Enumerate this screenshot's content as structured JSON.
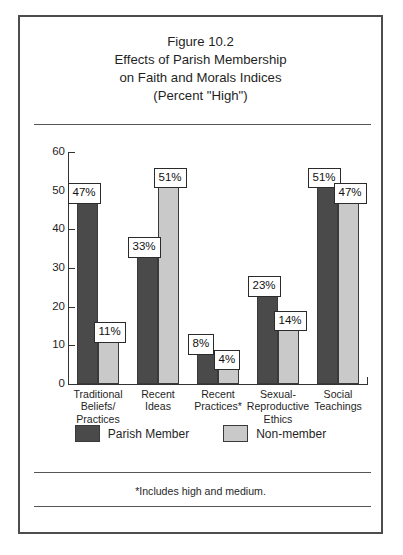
{
  "figure": {
    "title_lines": [
      "Figure 10.2",
      "Effects of Parish Membership",
      "on Faith and Morals Indices",
      "(Percent \"High\")"
    ],
    "footnote": "*Includes high and medium."
  },
  "legend": {
    "items": [
      {
        "label": "Parish Member",
        "color": "#4a4a4a",
        "swatch": "dark"
      },
      {
        "label": "Non-member",
        "color": "#c9c9c9",
        "swatch": "light"
      }
    ]
  },
  "axis": {
    "y_ticks": [
      "60",
      "50",
      "40",
      "30",
      "20",
      "10",
      "0"
    ]
  },
  "chart_data": {
    "type": "bar",
    "title": "Figure 10.2 Effects of Parish Membership on Faith and Morals Indices (Percent \"High\")",
    "xlabel": "",
    "ylabel": "",
    "ylim": [
      0,
      60
    ],
    "yticks": [
      0,
      10,
      20,
      30,
      40,
      50,
      60
    ],
    "grid": false,
    "legend_position": "bottom",
    "categories": [
      "Traditional Beliefs/ Practices",
      "Recent Ideas",
      "Recent Practices*",
      "Sexual- Reproductive Ethics",
      "Social Teachings"
    ],
    "category_lines": [
      [
        "Traditional",
        "Beliefs/",
        "Practices"
      ],
      [
        "Recent",
        "Ideas"
      ],
      [
        "Recent",
        "Practices*"
      ],
      [
        "Sexual-",
        "Reproductive",
        "Ethics"
      ],
      [
        "Social",
        "Teachings"
      ]
    ],
    "series": [
      {
        "name": "Parish Member",
        "color": "#4a4a4a",
        "values": [
          47,
          33,
          8,
          23,
          51
        ],
        "labels": [
          "47%",
          "33%",
          "8%",
          "23%",
          "51%"
        ]
      },
      {
        "name": "Non-member",
        "color": "#c9c9c9",
        "values": [
          11,
          51,
          4,
          14,
          47
        ],
        "labels": [
          "11%",
          "51%",
          "4%",
          "14%",
          "47%"
        ]
      }
    ],
    "annotations": [
      "*Includes high and medium."
    ]
  }
}
